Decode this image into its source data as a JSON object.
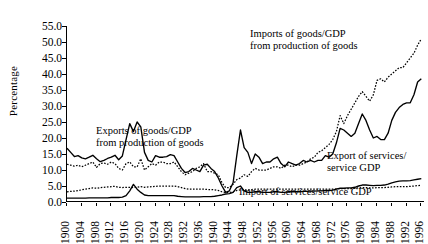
{
  "chart": {
    "ylabel": "Percentage",
    "yticks": [
      "0.0",
      "5.0",
      "10.0",
      "15.0",
      "20.0",
      "25.0",
      "30.0",
      "35.0",
      "40.0",
      "45.0",
      "50.0",
      "55.0"
    ],
    "xticks": [
      "1900",
      "1904",
      "1908",
      "1912",
      "1916",
      "1920",
      "1924",
      "1928",
      "1932",
      "1936",
      "1940",
      "1944",
      "1948",
      "1952",
      "1956",
      "1960",
      "1964",
      "1968",
      "1972",
      "1976",
      "1980",
      "1984",
      "1988",
      "1992",
      "1996"
    ],
    "annotations": {
      "exports_goods": "Exports of goods/GDP\nfrom production of goods",
      "exports_goods_l1": "Exports of goods/GDP",
      "exports_goods_l2": "from production of goods",
      "imports_goods_l1": "Imports of goods/GDP",
      "imports_goods_l2": "from production of goods",
      "export_services_l1": "Export of services/",
      "export_services_l2": "service GDP",
      "import_services": "Import of services/service GDP"
    }
  },
  "chart_data": {
    "type": "line",
    "title": "",
    "xlabel": "",
    "ylabel": "Percentage",
    "xlim": [
      1900,
      1997
    ],
    "ylim": [
      0,
      55
    ],
    "grid": false,
    "legend": "annotations-on-plot",
    "x": [
      1900,
      1901,
      1902,
      1903,
      1904,
      1905,
      1906,
      1907,
      1908,
      1909,
      1910,
      1911,
      1912,
      1913,
      1914,
      1915,
      1916,
      1917,
      1918,
      1919,
      1920,
      1921,
      1922,
      1923,
      1924,
      1925,
      1926,
      1927,
      1928,
      1929,
      1930,
      1931,
      1932,
      1933,
      1934,
      1935,
      1936,
      1937,
      1938,
      1939,
      1940,
      1941,
      1942,
      1943,
      1944,
      1945,
      1946,
      1947,
      1948,
      1949,
      1950,
      1951,
      1952,
      1953,
      1954,
      1955,
      1956,
      1957,
      1958,
      1959,
      1960,
      1961,
      1962,
      1963,
      1964,
      1965,
      1966,
      1967,
      1968,
      1969,
      1970,
      1971,
      1972,
      1973,
      1974,
      1975,
      1976,
      1977,
      1978,
      1979,
      1980,
      1981,
      1982,
      1983,
      1984,
      1985,
      1986,
      1987,
      1988,
      1989,
      1990,
      1991,
      1992,
      1993,
      1994,
      1995,
      1996
    ],
    "series": [
      {
        "name": "Exports of goods/GDP from production of goods",
        "style": "solid",
        "color": "#000000",
        "values": [
          16.8,
          15.5,
          14.2,
          14.5,
          13.8,
          13.5,
          14.0,
          14.6,
          13.5,
          12.6,
          13.0,
          13.6,
          14.0,
          14.6,
          13.2,
          14.4,
          19.5,
          24.5,
          22.0,
          25.0,
          23.5,
          15.5,
          13.0,
          12.5,
          14.5,
          14.0,
          14.0,
          14.2,
          14.8,
          14.5,
          12.5,
          10.5,
          9.2,
          9.5,
          10.5,
          10.0,
          9.5,
          11.5,
          11.8,
          10.5,
          9.5,
          7.5,
          5.0,
          3.0,
          3.5,
          6.0,
          14.5,
          22.5,
          17.0,
          15.5,
          12.0,
          15.0,
          14.0,
          12.0,
          12.5,
          12.5,
          13.5,
          14.0,
          12.0,
          11.0,
          12.5,
          12.0,
          11.5,
          12.0,
          13.0,
          12.5,
          13.0,
          12.5,
          13.0,
          13.0,
          14.5,
          14.0,
          15.0,
          18.5,
          23.0,
          22.5,
          21.5,
          20.5,
          21.5,
          24.5,
          27.5,
          25.5,
          22.5,
          20.0,
          20.5,
          19.5,
          19.5,
          21.5,
          25.5,
          28.0,
          29.5,
          30.5,
          31.0,
          31.0,
          33.5,
          37.5,
          38.5
        ]
      },
      {
        "name": "Imports of goods/GDP from production of goods",
        "style": "dotted",
        "color": "#000000",
        "values": [
          11.8,
          11.5,
          11.2,
          11.5,
          11.0,
          11.5,
          12.0,
          12.5,
          10.8,
          12.0,
          12.2,
          11.8,
          12.5,
          12.0,
          10.5,
          10.0,
          12.0,
          12.5,
          11.0,
          11.0,
          13.5,
          10.0,
          11.0,
          12.0,
          11.5,
          12.5,
          12.5,
          12.0,
          12.0,
          12.5,
          11.0,
          9.5,
          8.5,
          9.0,
          9.5,
          10.5,
          11.0,
          12.0,
          9.5,
          9.5,
          9.0,
          8.5,
          6.0,
          4.5,
          4.5,
          5.5,
          7.0,
          7.5,
          8.5,
          8.0,
          9.5,
          10.5,
          10.0,
          10.0,
          10.0,
          10.5,
          11.0,
          11.0,
          10.5,
          11.5,
          11.5,
          11.0,
          11.5,
          11.5,
          12.0,
          12.5,
          13.5,
          14.0,
          15.5,
          16.0,
          17.0,
          18.0,
          19.5,
          22.0,
          27.0,
          24.5,
          27.0,
          29.0,
          31.0,
          33.0,
          34.5,
          33.0,
          31.5,
          33.5,
          38.0,
          38.5,
          37.5,
          39.0,
          40.0,
          41.0,
          42.0,
          42.0,
          43.5,
          45.0,
          46.5,
          49.0,
          51.0
        ]
      },
      {
        "name": "Export of services/service GDP",
        "style": "solid",
        "color": "#000000",
        "values": [
          1.2,
          1.2,
          1.2,
          1.2,
          1.2,
          1.2,
          1.3,
          1.3,
          1.3,
          1.3,
          1.3,
          1.3,
          1.4,
          1.4,
          1.4,
          1.5,
          2.0,
          3.5,
          5.5,
          4.0,
          3.0,
          2.2,
          2.0,
          2.0,
          2.0,
          2.0,
          2.0,
          2.0,
          2.0,
          2.0,
          1.8,
          1.7,
          1.6,
          1.6,
          1.6,
          1.6,
          1.6,
          1.7,
          1.7,
          1.7,
          1.8,
          2.0,
          2.2,
          2.5,
          2.6,
          3.0,
          4.5,
          5.0,
          3.5,
          3.0,
          3.0,
          3.2,
          3.2,
          3.0,
          3.0,
          3.0,
          3.2,
          3.2,
          3.0,
          3.0,
          3.2,
          3.2,
          3.2,
          3.2,
          3.3,
          3.3,
          3.4,
          3.4,
          3.5,
          3.5,
          3.6,
          3.6,
          3.7,
          4.0,
          4.3,
          4.3,
          4.4,
          4.4,
          4.6,
          5.0,
          5.3,
          5.3,
          5.2,
          5.1,
          5.2,
          5.2,
          5.3,
          5.6,
          6.0,
          6.3,
          6.5,
          6.6,
          6.6,
          6.7,
          6.9,
          7.1,
          7.3
        ]
      },
      {
        "name": "Import of services/service GDP",
        "style": "dotted",
        "color": "#000000",
        "values": [
          3.2,
          3.3,
          3.4,
          3.6,
          3.8,
          4.0,
          4.2,
          4.4,
          4.3,
          4.5,
          4.6,
          4.7,
          4.8,
          4.9,
          4.6,
          4.5,
          4.6,
          4.6,
          4.5,
          4.6,
          4.8,
          4.6,
          4.7,
          4.8,
          4.9,
          5.0,
          5.0,
          5.0,
          5.0,
          5.0,
          4.8,
          4.5,
          4.2,
          4.0,
          4.0,
          4.0,
          4.0,
          4.0,
          3.9,
          3.9,
          3.8,
          3.6,
          3.2,
          3.0,
          3.0,
          3.2,
          3.6,
          3.8,
          3.8,
          3.8,
          3.9,
          4.0,
          4.0,
          4.0,
          4.0,
          4.0,
          4.0,
          4.0,
          4.0,
          4.0,
          4.0,
          4.0,
          4.0,
          4.0,
          4.0,
          4.0,
          4.0,
          4.0,
          4.0,
          4.0,
          4.0,
          4.0,
          4.0,
          4.1,
          4.2,
          4.2,
          4.2,
          4.2,
          4.3,
          4.4,
          4.5,
          4.5,
          4.4,
          4.4,
          4.5,
          4.5,
          4.5,
          4.6,
          4.7,
          4.8,
          4.8,
          4.8,
          4.8,
          4.9,
          5.0,
          5.1,
          5.2
        ]
      }
    ]
  }
}
